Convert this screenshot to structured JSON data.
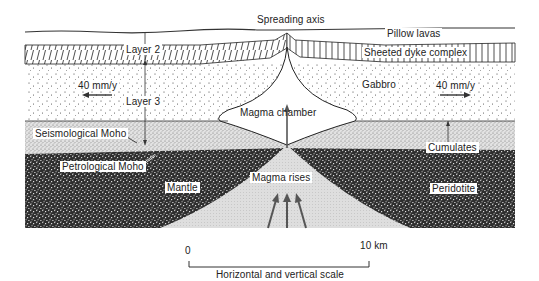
{
  "diagram": {
    "title": "Spreading axis",
    "type": "cross-section",
    "layers": {
      "pillow_lavas": "Pillow lavas",
      "sheeted_dykes": "Sheeted dyke complex",
      "gabbro": "Gabbro",
      "cumulates": "Cumulates",
      "peridotite": "Peridotite",
      "mantle": "Mantle",
      "magma_chamber": "Magma chamber",
      "magma_rises": "Magma rises"
    },
    "seismic_layers": {
      "layer2": "Layer 2",
      "layer3": "Layer 3"
    },
    "boundaries": {
      "seismological_moho": "Seismological Moho",
      "petrological_moho": "Petrological Moho"
    },
    "spreading_rate": {
      "left": "40 mm/y",
      "right": "40 mm/y"
    },
    "scale_bar": {
      "start": "0",
      "end": "10 km",
      "caption": "Horizontal and vertical scale"
    },
    "colors": {
      "ink": "#222222",
      "background": "#ffffff",
      "mantle_dark": "#3a3a3a",
      "cumulate_light": "#d8d8d8",
      "upwelling": "#dcdcdc"
    }
  }
}
